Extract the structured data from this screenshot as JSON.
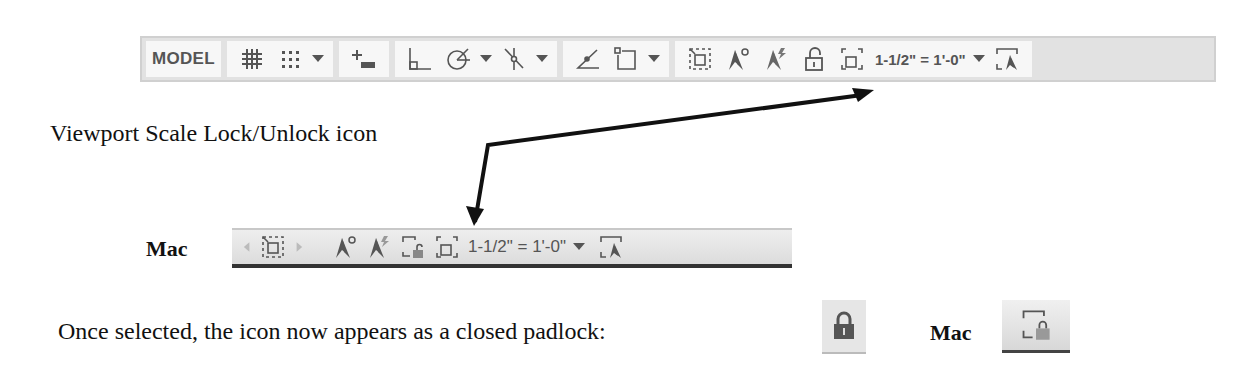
{
  "windows_statusbar": {
    "model_label": "MODEL",
    "icons": [
      "grid-icon",
      "snap-icon",
      "dropdown",
      "dynamic-input-icon",
      "ortho-icon",
      "polar-tracking-icon",
      "dropdown",
      "object-snap-tracking-icon",
      "dropdown",
      "isometric-drafting-icon",
      "object-snap-icon",
      "dropdown",
      "maximize-viewport-icon",
      "annotation-visibility-icon",
      "auto-scale-icon",
      "viewport-lock-icon",
      "selection-cycling-icon",
      "viewport-scale-dropdown",
      "annotation-scale-icon"
    ],
    "scale_value": "1-1/2\" = 1'-0\""
  },
  "annotations": {
    "callout_label": "Viewport Scale Lock/Unlock icon",
    "mac_label": "Mac",
    "closed_padlock_text": "Once selected, the icon now appears as a closed padlock:",
    "mac_label_2": "Mac"
  },
  "mac_statusbar": {
    "scale_value": "1-1/2\" = 1'-0\""
  },
  "colors": {
    "toolbar_bg": "#f7f7f7",
    "toolbar_frame": "#e2e2e2",
    "icon_gray": "#555555",
    "padlock_closed": "#555555",
    "mac_lock": "#8a8a8a",
    "arrow": "#111111"
  }
}
